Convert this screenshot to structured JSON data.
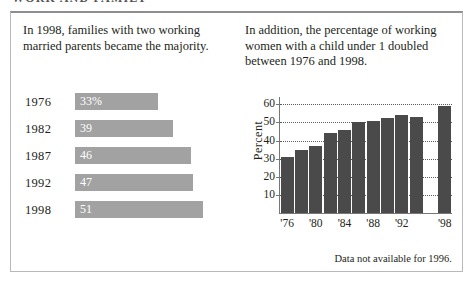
{
  "page_title": "WORK AND FAMILY",
  "left": {
    "caption": "In 1998, families with two working married parents became the majority.",
    "footnote": ""
  },
  "right": {
    "caption": "In addition, the percentage of working women with a child under 1 doubled between 1976 and 1998.",
    "footnote": "Data not available for 1996."
  },
  "colors": {
    "hbar_fill": "#a2a2a2",
    "vbar_fill": "#4a4a4a",
    "frame": "#b9b9b9",
    "grid": "#5a5a5a",
    "text": "#231f20"
  },
  "chart_data": [
    {
      "type": "bar",
      "orientation": "horizontal",
      "title": "In 1998, families with two working married parents became the majority.",
      "xlabel": "",
      "ylabel": "",
      "categories": [
        "1976",
        "1982",
        "1987",
        "1992",
        "1998"
      ],
      "values": [
        33,
        39,
        46,
        47,
        51
      ],
      "data_labels": [
        "33%",
        "39",
        "46",
        "47",
        "51"
      ],
      "xlim": [
        0,
        58
      ],
      "grid": false,
      "legend": "none"
    },
    {
      "type": "bar",
      "orientation": "vertical",
      "title": "In addition, the percentage of working women with a child under 1 doubled between 1976 and 1998.",
      "xlabel": "",
      "ylabel": "Percent",
      "categories": [
        "'76",
        "'78",
        "'80",
        "'82",
        "'84",
        "'86",
        "'88",
        "'90",
        "'92",
        "'94",
        "'96",
        "'98"
      ],
      "values": [
        31,
        35,
        37,
        44,
        46,
        50,
        51,
        52.5,
        54,
        53,
        null,
        59
      ],
      "tick_labels_shown": [
        "'76",
        "'80",
        "'84",
        "'88",
        "'92",
        "'98"
      ],
      "yticks": [
        10,
        20,
        30,
        40,
        50,
        60
      ],
      "ylim": [
        0,
        64
      ],
      "grid": true,
      "grid_style": "dotted-horizontal",
      "legend": "none",
      "annotation": "Data not available for 1996."
    }
  ]
}
